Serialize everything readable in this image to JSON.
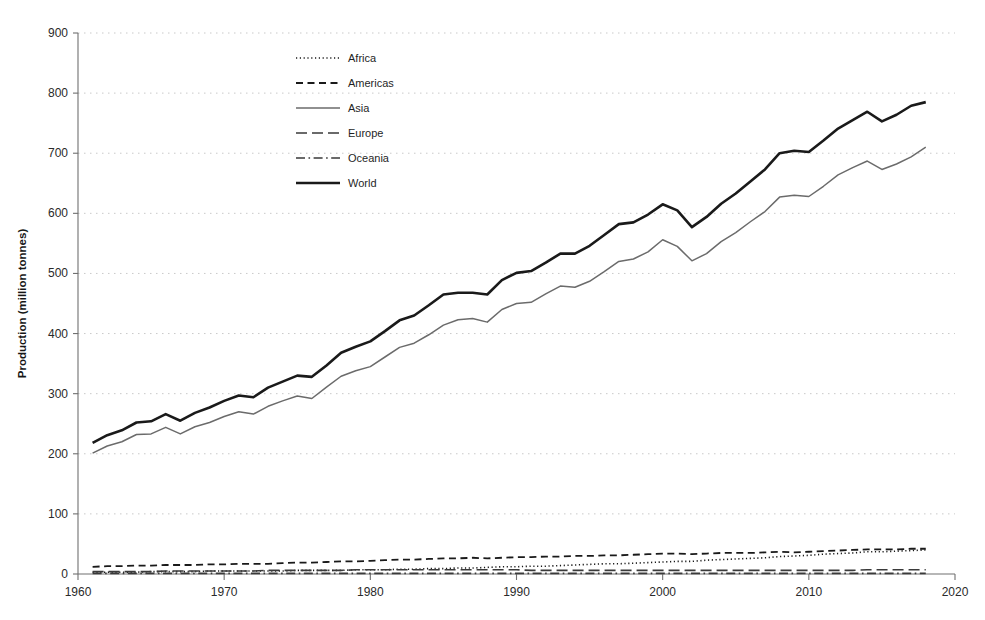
{
  "chart_data": {
    "type": "line",
    "title": "",
    "xlabel": "",
    "ylabel": "Production (million tonnes)",
    "xlim": [
      1960,
      2020
    ],
    "ylim": [
      0,
      900
    ],
    "xticks": [
      1960,
      1970,
      1980,
      1990,
      2000,
      2010,
      2020
    ],
    "xtick_labels": [
      "1960",
      "1970",
      "1980",
      "1990",
      "2000",
      "2010",
      "2020"
    ],
    "yticks": [
      0,
      100,
      200,
      300,
      400,
      500,
      600,
      700,
      800,
      900
    ],
    "ytick_labels": [
      "0",
      "100",
      "200",
      "300",
      "400",
      "500",
      "600",
      "700",
      "800",
      "900"
    ],
    "grid": true,
    "grid_style": "dotted-horizontal",
    "legend_position": "upper-left-inside",
    "x": [
      1961,
      1962,
      1963,
      1964,
      1965,
      1966,
      1967,
      1968,
      1969,
      1970,
      1971,
      1972,
      1973,
      1974,
      1975,
      1976,
      1977,
      1978,
      1979,
      1980,
      1981,
      1982,
      1983,
      1984,
      1985,
      1986,
      1987,
      1988,
      1989,
      1990,
      1991,
      1992,
      1993,
      1994,
      1995,
      1996,
      1997,
      1998,
      1999,
      2000,
      2001,
      2002,
      2003,
      2004,
      2005,
      2006,
      2007,
      2008,
      2009,
      2010,
      2011,
      2012,
      2013,
      2014,
      2015,
      2016,
      2017,
      2018
    ],
    "series": [
      {
        "name": "Africa",
        "style": "dotted",
        "color": "#1a1a1a",
        "width": 1.6,
        "values": [
          3,
          3,
          3,
          3,
          4,
          4,
          4,
          4,
          5,
          5,
          5,
          5,
          5,
          5,
          6,
          6,
          6,
          6,
          7,
          7,
          7,
          8,
          8,
          9,
          9,
          10,
          10,
          11,
          12,
          12,
          13,
          13,
          14,
          15,
          16,
          17,
          17,
          18,
          19,
          20,
          21,
          21,
          23,
          24,
          25,
          26,
          27,
          29,
          30,
          31,
          33,
          34,
          35,
          37,
          37,
          38,
          39,
          40
        ]
      },
      {
        "name": "Americas",
        "style": "dashed",
        "color": "#1a1a1a",
        "width": 1.8,
        "values": [
          12,
          13,
          13,
          14,
          14,
          15,
          15,
          15,
          16,
          16,
          17,
          17,
          17,
          18,
          19,
          19,
          20,
          21,
          21,
          22,
          23,
          24,
          24,
          25,
          26,
          26,
          27,
          26,
          27,
          28,
          28,
          29,
          29,
          30,
          30,
          31,
          31,
          32,
          33,
          34,
          34,
          33,
          34,
          35,
          35,
          35,
          36,
          37,
          36,
          37,
          38,
          39,
          40,
          41,
          41,
          41,
          42,
          42
        ]
      },
      {
        "name": "Asia",
        "style": "solid-thin",
        "color": "#6b6b6b",
        "width": 1.5,
        "values": [
          201,
          213,
          220,
          232,
          233,
          244,
          233,
          245,
          252,
          262,
          270,
          266,
          279,
          288,
          296,
          292,
          311,
          329,
          338,
          345,
          361,
          377,
          384,
          398,
          414,
          423,
          425,
          419,
          440,
          450,
          452,
          466,
          479,
          477,
          487,
          503,
          520,
          524,
          536,
          556,
          545,
          521,
          533,
          553,
          568,
          586,
          603,
          627,
          630,
          628,
          645,
          664,
          676,
          687,
          673,
          682,
          694,
          710
        ]
      },
      {
        "name": "Europe",
        "style": "long-dash",
        "color": "#3a3a3a",
        "width": 1.6,
        "values": [
          4,
          4,
          4,
          4,
          4,
          5,
          5,
          5,
          5,
          5,
          5,
          5,
          6,
          6,
          6,
          6,
          6,
          6,
          7,
          7,
          7,
          7,
          7,
          7,
          7,
          7,
          7,
          7,
          7,
          7,
          6,
          6,
          6,
          6,
          6,
          6,
          6,
          6,
          6,
          6,
          6,
          6,
          6,
          6,
          6,
          6,
          6,
          6,
          6,
          6,
          6,
          6,
          6,
          7,
          7,
          7,
          7,
          7
        ]
      },
      {
        "name": "Oceania",
        "style": "dash-dot",
        "color": "#3a3a3a",
        "width": 1.6,
        "values": [
          1,
          1,
          1,
          1,
          1,
          1,
          1,
          1,
          1,
          1,
          1,
          1,
          1,
          1,
          1,
          1,
          1,
          1,
          1,
          1,
          1,
          1,
          1,
          1,
          1,
          1,
          1,
          1,
          1,
          1,
          1,
          1,
          1,
          1,
          1,
          1,
          1,
          1,
          1,
          1,
          1,
          1,
          1,
          1,
          1,
          1,
          1,
          1,
          1,
          1,
          1,
          1,
          1,
          1,
          1,
          1,
          1,
          1
        ]
      },
      {
        "name": "World",
        "style": "solid-thick",
        "color": "#1a1a1a",
        "width": 2.6,
        "values": [
          218,
          231,
          239,
          252,
          254,
          266,
          255,
          268,
          277,
          288,
          297,
          294,
          310,
          320,
          330,
          328,
          347,
          368,
          378,
          387,
          404,
          422,
          430,
          447,
          465,
          468,
          468,
          465,
          489,
          501,
          504,
          518,
          533,
          533,
          546,
          564,
          582,
          585,
          598,
          615,
          605,
          577,
          594,
          616,
          633,
          653,
          673,
          700,
          704,
          702,
          721,
          741,
          755,
          769,
          753,
          764,
          779,
          785
        ]
      }
    ]
  },
  "axis": {
    "y_label": "Production (million tonnes)"
  },
  "legend": {
    "items": [
      {
        "label": "Africa",
        "swatch": "dotted-line-swatch"
      },
      {
        "label": "Americas",
        "swatch": "dashed-line-swatch"
      },
      {
        "label": "Asia",
        "swatch": "thin-solid-line-swatch"
      },
      {
        "label": "Europe",
        "swatch": "long-dash-line-swatch"
      },
      {
        "label": "Oceania",
        "swatch": "dash-dot-line-swatch"
      },
      {
        "label": "World",
        "swatch": "thick-solid-line-swatch"
      }
    ]
  },
  "colors": {
    "ink": "#1a1a1a",
    "asia_gray": "#6b6b6b",
    "grid": "#c9c9c9",
    "axis": "#707070",
    "background": "#ffffff"
  }
}
